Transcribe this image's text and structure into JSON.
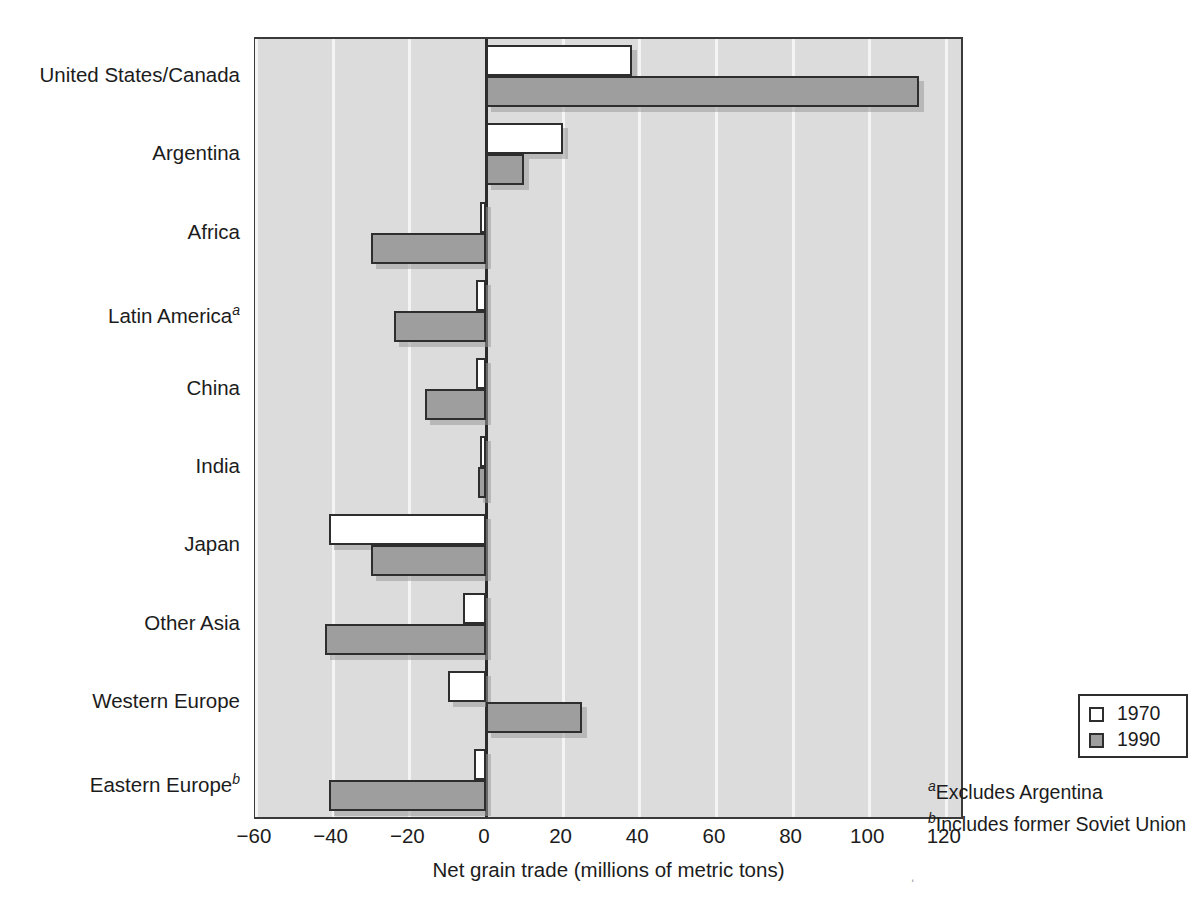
{
  "chart_data": {
    "type": "bar",
    "orientation": "horizontal",
    "title": "",
    "xlabel": "Net grain trade (millions of metric tons)",
    "ylabel": "",
    "xlim": [
      -60,
      125
    ],
    "xticks": [
      -60,
      -40,
      -20,
      0,
      20,
      40,
      60,
      80,
      100,
      120
    ],
    "xticklabels": [
      "−60",
      "−40",
      "−20",
      "0",
      "20",
      "40",
      "60",
      "80",
      "100",
      "120"
    ],
    "grid": true,
    "grid_axis": "x",
    "legend_position": "lower right",
    "categories": [
      "United States/Canada",
      "Argentina",
      "Africa",
      "Latin America",
      "China",
      "India",
      "Japan",
      "Other Asia",
      "Western Europe",
      "Eastern Europe"
    ],
    "category_footnote_marks": [
      "",
      "",
      "",
      "a",
      "",
      "",
      "",
      "",
      "",
      "b"
    ],
    "series": [
      {
        "name": "1970",
        "color": "#ffffff",
        "values": [
          38,
          20,
          -1.5,
          -2.5,
          -2.5,
          -1.5,
          -41,
          -6,
          -10,
          -3
        ]
      },
      {
        "name": "1990",
        "color": "#9e9e9e",
        "values": [
          113,
          10,
          -30,
          -24,
          -16,
          -2,
          -30,
          -42,
          25,
          -41
        ]
      }
    ],
    "footnotes": [
      {
        "mark": "a",
        "text": "Excludes Argentina"
      },
      {
        "mark": "b",
        "text": "Includes former Soviet Union"
      }
    ]
  },
  "axis": {
    "x_title": "Net grain trade (millions of metric tons)"
  },
  "legend": {
    "entries": [
      {
        "label": "1970",
        "style": "s1970"
      },
      {
        "label": "1990",
        "style": "s1990"
      }
    ]
  },
  "colors": {
    "plot_background": "#dcdcdc",
    "gridline": "#f4f4f4",
    "frame": "#3a3a3a",
    "bar_1970": "#ffffff",
    "bar_1990": "#9e9e9e",
    "text": "#1c1c1c"
  },
  "stray_mark": "ʹ"
}
